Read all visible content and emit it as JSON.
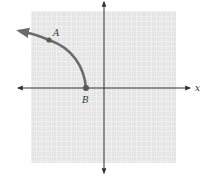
{
  "figure": {
    "type": "coordinate-graph",
    "axes": {
      "x_label": "x",
      "y_label": ""
    },
    "points": [
      {
        "label": "A",
        "x": 49,
        "y": 40,
        "label_x": 55,
        "label_y": 36
      },
      {
        "label": "B",
        "x": 86,
        "y": 88,
        "label_x": 82,
        "label_y": 103
      }
    ],
    "curve": {
      "description": "Arc starting at point B on the negative x-axis, curving up and to the left through point A, ending in an arrow",
      "endpoint": "B",
      "direction": "left-up",
      "arrow_end": true
    },
    "colors": {
      "grid_background": "#e6e6e6",
      "grid_line": "#ffffff",
      "axis": "#333333",
      "curve": "#6b6b6b",
      "point": "#5a5a5a",
      "label": "#333333"
    }
  }
}
